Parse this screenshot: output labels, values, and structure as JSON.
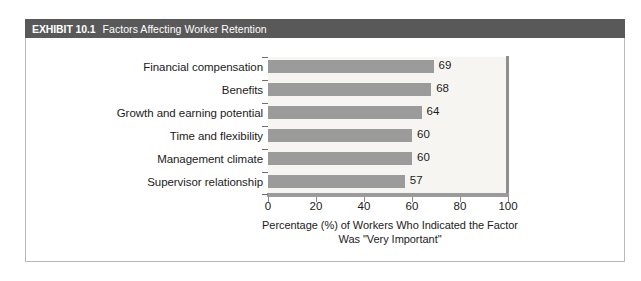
{
  "exhibit": {
    "tag": "EXHIBIT 10.1",
    "title": "Factors Affecting Worker Retention",
    "banner_color": "#595959",
    "frame_border_color": "#b9b9b9"
  },
  "chart_data": {
    "type": "bar",
    "orientation": "horizontal",
    "title": "Factors Affecting Worker Retention",
    "categories": [
      "Financial compensation",
      "Benefits",
      "Growth and earning potential",
      "Time and flexibility",
      "Management climate",
      "Supervisor relationship"
    ],
    "values": [
      69,
      68,
      64,
      60,
      60,
      57
    ],
    "value_labels": [
      "69",
      "68",
      "64",
      "60",
      "60",
      "57"
    ],
    "xlabel_line1": "Percentage (%) of Workers Who Indicated the Factor",
    "xlabel_line2": "Was \"Very Important\"",
    "ylabel": "",
    "xlim": [
      0,
      100
    ],
    "xticks": [
      0,
      20,
      40,
      60,
      80,
      100
    ],
    "xtick_labels": [
      "0",
      "20",
      "40",
      "60",
      "80",
      "100"
    ],
    "grid": false,
    "legend": null,
    "bar_color": "#9b9b9b",
    "plot_background": "#f6f5f2",
    "axis_color": "#9b9b9b"
  }
}
